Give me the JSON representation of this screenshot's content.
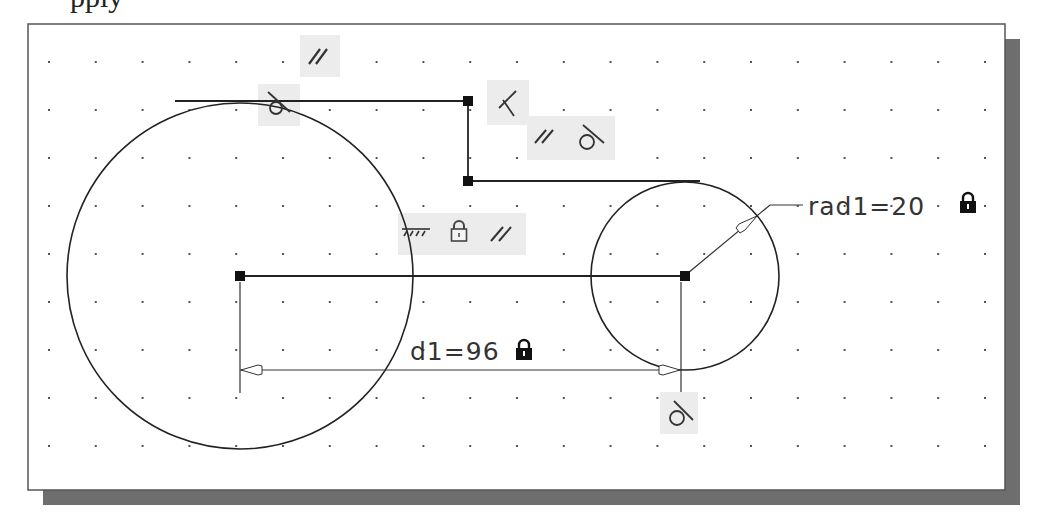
{
  "caption_fragment": "pply",
  "viewport": {
    "frame": {
      "x": 28,
      "y": 24,
      "width": 977,
      "height": 466,
      "border": "#555555",
      "fill": "#ffffff"
    },
    "shadow": {
      "offset": 15,
      "color": "#6e6e6e"
    },
    "grid": {
      "x0": 49,
      "y0": 62,
      "dx": 46.8,
      "dy": 48,
      "cols": 21,
      "rows": 9,
      "dot_color": "#555555"
    }
  },
  "geometry": {
    "circle_large": {
      "cx": 240,
      "cy": 276,
      "r": 173
    },
    "circle_small": {
      "cx": 685,
      "cy": 276,
      "r": 94
    },
    "lines": [
      {
        "name": "top-line",
        "x1": 175,
        "y1": 101,
        "x2": 468,
        "y2": 101
      },
      {
        "name": "vertical-step",
        "x1": 468,
        "y1": 101,
        "x2": 468,
        "y2": 181
      },
      {
        "name": "upper-right-line",
        "x1": 468,
        "y1": 181,
        "x2": 700,
        "y2": 181
      },
      {
        "name": "center-line",
        "x1": 240,
        "y1": 276,
        "x2": 685,
        "y2": 276
      }
    ],
    "vertices": [
      [
        468,
        101
      ],
      [
        468,
        181
      ],
      [
        240,
        276
      ],
      [
        685,
        276
      ]
    ]
  },
  "dimensions": {
    "d1": {
      "label": "d1=96",
      "name": "d1",
      "value": 96,
      "locked": true,
      "y": 370,
      "x1": 240,
      "x2": 681
    },
    "rad1": {
      "label": "rad1=20",
      "name": "rad1",
      "value": 20,
      "locked": true
    }
  },
  "constraints": [
    {
      "type": "parallel",
      "symbol": "//",
      "x": 300,
      "y": 35,
      "w": 40,
      "h": 42
    },
    {
      "type": "tangent",
      "symbol": "tangent",
      "x": 258,
      "y": 84,
      "w": 42,
      "h": 42
    },
    {
      "type": "perpendicular",
      "symbol": "perpendicular",
      "x": 487,
      "y": 80,
      "w": 42,
      "h": 45
    },
    {
      "type": "parallel-tangent",
      "symbol": "// tangent",
      "x": 527,
      "y": 116,
      "w": 88,
      "h": 44
    },
    {
      "type": "ground-lock-parallel",
      "symbol": "ground lock //",
      "x": 398,
      "y": 213,
      "w": 128,
      "h": 42
    },
    {
      "type": "tangent",
      "symbol": "tangent",
      "x": 660,
      "y": 392,
      "w": 38,
      "h": 42
    }
  ],
  "colors": {
    "line": "#222222",
    "constraint_bg": "#ececec",
    "lock": "#111111",
    "text": "#333333"
  }
}
